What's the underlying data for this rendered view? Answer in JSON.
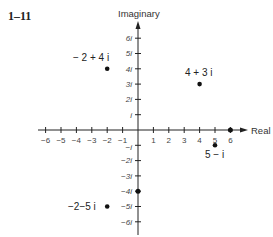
{
  "figure": {
    "label": "1–11",
    "x_axis_title": "Real",
    "y_axis_title": "Imaginary"
  },
  "axes": {
    "x_ticks": [
      "−6",
      "−5",
      "−4",
      "−3",
      "−2",
      "−1",
      "1",
      "2",
      "3",
      "4",
      "5",
      "6"
    ],
    "y_ticks_pos": [
      "i",
      "2i",
      "3i",
      "4i",
      "5i",
      "6i"
    ],
    "y_ticks_neg": [
      "−i",
      "−2i",
      "−3i",
      "−4i",
      "−5i",
      "−6i"
    ]
  },
  "points": [
    {
      "label": "− 2 + 4 i",
      "re": -2,
      "im": 4
    },
    {
      "label": "4 + 3 i",
      "re": 4,
      "im": 3
    },
    {
      "label": "5 − i",
      "re": 5,
      "im": -1
    },
    {
      "label": "−2−5 i",
      "re": -2,
      "im": -5
    },
    {
      "label": "",
      "re": 6,
      "im": 0
    },
    {
      "label": "",
      "re": 0,
      "im": -4
    }
  ],
  "colors": {
    "ink": "#222222",
    "background": "#ffffff"
  }
}
